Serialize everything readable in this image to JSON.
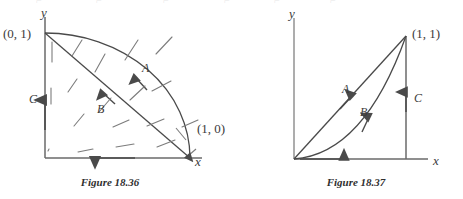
{
  "page": {
    "width": 463,
    "height": 199,
    "background": "#ffffff",
    "ink": "#4a4a4a",
    "text_color": "#3b3b3b"
  },
  "figures": [
    {
      "id": "figure-18-36",
      "caption": "Figure 18.36",
      "axis_labels": {
        "x": "x",
        "y": "y"
      },
      "point_labels": [
        {
          "name": "origin-y-point",
          "text": "(0, 1)"
        },
        {
          "name": "x-axis-point",
          "text": "(1, 0)"
        }
      ],
      "path_labels": [
        {
          "name": "path-a",
          "text": "A"
        },
        {
          "name": "path-b",
          "text": "B"
        },
        {
          "name": "path-c",
          "text": "C"
        }
      ],
      "description": "Quarter circle arc A from (0,1) to (1,0), straight diagonal chord B, vertical segment C on the y-axis, horizontal segment along the x-axis, with a vector field of short line segments.",
      "vector_field": {
        "segments": [
          {
            "x1": 45,
            "y1": 40,
            "x2": 45,
            "y2": 62
          },
          {
            "x1": 44,
            "y1": 84,
            "x2": 44,
            "y2": 102
          },
          {
            "x1": 45,
            "y1": 147,
            "x2": 46,
            "y2": 149
          },
          {
            "x1": 72,
            "y1": 55,
            "x2": 82,
            "y2": 38
          },
          {
            "x1": 66,
            "y1": 90,
            "x2": 76,
            "y2": 76
          },
          {
            "x1": 72,
            "y1": 124,
            "x2": 83,
            "y2": 112
          },
          {
            "x1": 77,
            "y1": 152,
            "x2": 92,
            "y2": 149
          },
          {
            "x1": 94,
            "y1": 71,
            "x2": 104,
            "y2": 52
          },
          {
            "x1": 98,
            "y1": 110,
            "x2": 110,
            "y2": 96
          },
          {
            "x1": 112,
            "y1": 125,
            "x2": 128,
            "y2": 118
          },
          {
            "x1": 115,
            "y1": 146,
            "x2": 133,
            "y2": 143
          },
          {
            "x1": 124,
            "y1": 58,
            "x2": 137,
            "y2": 38
          },
          {
            "x1": 129,
            "y1": 98,
            "x2": 144,
            "y2": 84
          },
          {
            "x1": 146,
            "y1": 124,
            "x2": 163,
            "y2": 118
          },
          {
            "x1": 155,
            "y1": 52,
            "x2": 171,
            "y2": 35
          },
          {
            "x1": 151,
            "y1": 89,
            "x2": 170,
            "y2": 79
          },
          {
            "x1": 155,
            "y1": 146,
            "x2": 174,
            "y2": 139
          },
          {
            "x1": 181,
            "y1": 125,
            "x2": 197,
            "y2": 118
          }
        ]
      }
    },
    {
      "id": "figure-18-37",
      "caption": "Figure 18.37",
      "axis_labels": {
        "x": "x",
        "y": "y"
      },
      "point_labels": [
        {
          "name": "corner-point",
          "text": "(1, 1)"
        }
      ],
      "path_labels": [
        {
          "name": "path-a",
          "text": "A"
        },
        {
          "name": "path-b",
          "text": "B"
        },
        {
          "name": "path-c",
          "text": "C"
        }
      ],
      "description": "Straight line A from origin to (1,1), curved path B below it from origin to (1,1), vertical segment C rising along x=1, horizontal segment along the x-axis."
    }
  ],
  "artifacts": {
    "top_cropped_text": "· · · · · ·"
  }
}
